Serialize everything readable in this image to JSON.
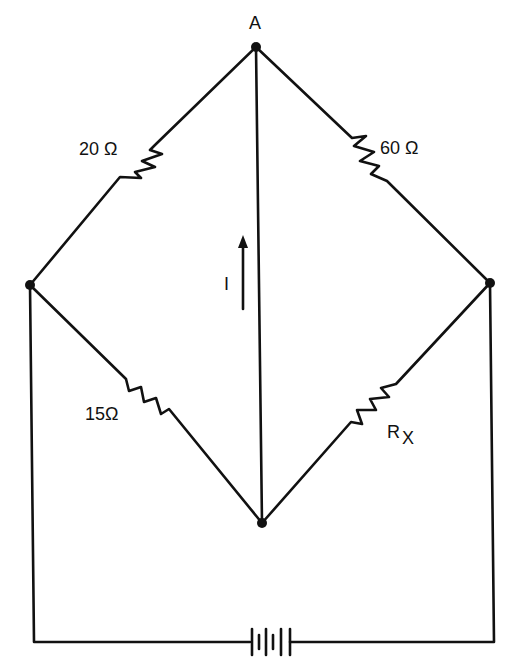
{
  "diagram": {
    "type": "wheatstone-bridge-circuit",
    "nodes": {
      "top": {
        "label": "A"
      },
      "left": {
        "label": ""
      },
      "right": {
        "label": ""
      },
      "bottom": {
        "label": ""
      }
    },
    "resistors": [
      {
        "id": "r1",
        "label": "20 Ω",
        "between": [
          "A",
          "left"
        ]
      },
      {
        "id": "r2",
        "label": "60 Ω",
        "between": [
          "A",
          "right"
        ]
      },
      {
        "id": "r3",
        "label": "15Ω",
        "between": [
          "left",
          "bottom"
        ]
      },
      {
        "id": "r4",
        "label": "R",
        "subscript": "X",
        "between": [
          "right",
          "bottom"
        ]
      }
    ],
    "current": {
      "label": "I",
      "direction": "up",
      "branch": "A-bottom"
    },
    "battery": {
      "label": "",
      "location": "bottom rail between left and right nodes"
    }
  }
}
